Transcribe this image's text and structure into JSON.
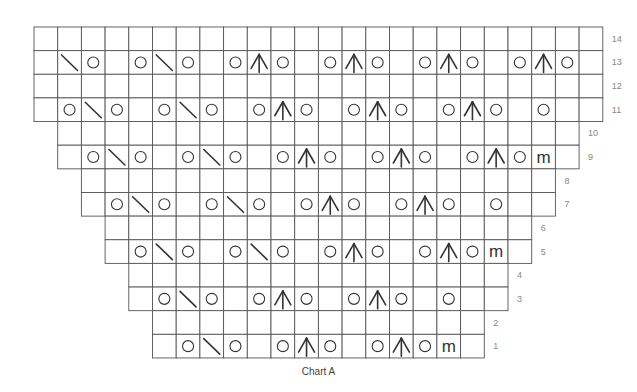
{
  "chart_data": {
    "type": "table",
    "title": "Chart A",
    "grid": {
      "origin_x": 34,
      "origin_y": 27,
      "cell_w": 23.7,
      "cell_h": 23.64,
      "total_columns": 24,
      "total_rows": 14
    },
    "legend_symbols": {
      "_": "blank (knit)",
      "O": "yarn over (circle)",
      "\\": "slanted decrease (backslash)",
      "A": "centered double decrease (inverted V with vertical line)",
      "m": "make one / marker stitch (m)"
    },
    "rows": [
      {
        "row": 14,
        "start_col": 0,
        "cells": [
          "_",
          "_",
          "_",
          "_",
          "_",
          "_",
          "_",
          "_",
          "_",
          "_",
          "_",
          "_",
          "_",
          "_",
          "_",
          "_",
          "_",
          "_",
          "_",
          "_",
          "_",
          "_",
          "_",
          "_"
        ]
      },
      {
        "row": 13,
        "start_col": 0,
        "cells": [
          "_",
          "\\",
          "O",
          "_",
          "O",
          "\\",
          "O",
          "_",
          "O",
          "A",
          "O",
          "_",
          "O",
          "A",
          "O",
          "_",
          "O",
          "A",
          "O",
          "_",
          "O",
          "A",
          "O",
          "_"
        ]
      },
      {
        "row": 12,
        "start_col": 0,
        "cells": [
          "_",
          "_",
          "_",
          "_",
          "_",
          "_",
          "_",
          "_",
          "_",
          "_",
          "_",
          "_",
          "_",
          "_",
          "_",
          "_",
          "_",
          "_",
          "_",
          "_",
          "_",
          "_",
          "_",
          "_"
        ]
      },
      {
        "row": 11,
        "start_col": 0,
        "cells": [
          "_",
          "O",
          "\\",
          "O",
          "_",
          "O",
          "\\",
          "O",
          "_",
          "O",
          "A",
          "O",
          "_",
          "O",
          "A",
          "O",
          "_",
          "O",
          "A",
          "O",
          "_",
          "O",
          "_",
          "_"
        ]
      },
      {
        "row": 10,
        "start_col": 1,
        "cells": [
          "_",
          "_",
          "_",
          "_",
          "_",
          "_",
          "_",
          "_",
          "_",
          "_",
          "_",
          "_",
          "_",
          "_",
          "_",
          "_",
          "_",
          "_",
          "_",
          "_",
          "_",
          "_"
        ]
      },
      {
        "row": 9,
        "start_col": 1,
        "cells": [
          "_",
          "O",
          "\\",
          "O",
          "_",
          "O",
          "\\",
          "O",
          "_",
          "O",
          "A",
          "O",
          "_",
          "O",
          "A",
          "O",
          "_",
          "O",
          "A",
          "O",
          "m",
          "_"
        ]
      },
      {
        "row": 8,
        "start_col": 2,
        "cells": [
          "_",
          "_",
          "_",
          "_",
          "_",
          "_",
          "_",
          "_",
          "_",
          "_",
          "_",
          "_",
          "_",
          "_",
          "_",
          "_",
          "_",
          "_",
          "_",
          "_"
        ]
      },
      {
        "row": 7,
        "start_col": 2,
        "cells": [
          "_",
          "O",
          "\\",
          "O",
          "_",
          "O",
          "\\",
          "O",
          "_",
          "O",
          "A",
          "O",
          "_",
          "O",
          "A",
          "O",
          "_",
          "O",
          "_",
          "_"
        ]
      },
      {
        "row": 6,
        "start_col": 3,
        "cells": [
          "_",
          "_",
          "_",
          "_",
          "_",
          "_",
          "_",
          "_",
          "_",
          "_",
          "_",
          "_",
          "_",
          "_",
          "_",
          "_",
          "_",
          "_"
        ]
      },
      {
        "row": 5,
        "start_col": 3,
        "cells": [
          "_",
          "O",
          "\\",
          "O",
          "_",
          "O",
          "\\",
          "O",
          "_",
          "O",
          "A",
          "O",
          "_",
          "O",
          "A",
          "O",
          "m",
          "_"
        ]
      },
      {
        "row": 4,
        "start_col": 4,
        "cells": [
          "_",
          "_",
          "_",
          "_",
          "_",
          "_",
          "_",
          "_",
          "_",
          "_",
          "_",
          "_",
          "_",
          "_",
          "_",
          "_"
        ]
      },
      {
        "row": 3,
        "start_col": 4,
        "cells": [
          "_",
          "O",
          "\\",
          "O",
          "_",
          "O",
          "A",
          "O",
          "_",
          "O",
          "A",
          "O",
          "_",
          "O",
          "_",
          "_"
        ]
      },
      {
        "row": 2,
        "start_col": 5,
        "cells": [
          "_",
          "_",
          "_",
          "_",
          "_",
          "_",
          "_",
          "_",
          "_",
          "_",
          "_",
          "_",
          "_",
          "_"
        ]
      },
      {
        "row": 1,
        "start_col": 5,
        "cells": [
          "_",
          "O",
          "\\",
          "O",
          "_",
          "O",
          "A",
          "O",
          "_",
          "O",
          "A",
          "O",
          "m",
          "_"
        ]
      }
    ],
    "row_labels": [
      "14",
      "13",
      "12",
      "11",
      "10",
      "9",
      "8",
      "7",
      "6",
      "5",
      "4",
      "3",
      "2",
      "1"
    ],
    "colors": {
      "grid_line": "#555555",
      "symbol": "#333333",
      "row_label": "#888888",
      "background": "#ffffff"
    }
  },
  "caption": "Chart A"
}
